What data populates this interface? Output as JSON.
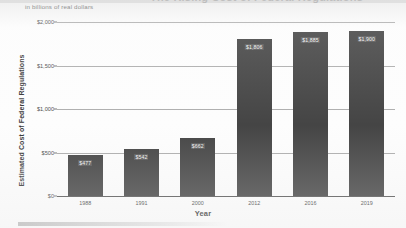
{
  "chart_data": {
    "type": "bar",
    "title": "The Rising Cost of Federal Regulations",
    "subtitle": "in billions of real dollars",
    "xlabel": "Year",
    "ylabel": "Estimated Cost of Federal Regulations",
    "categories": [
      "1988",
      "1991",
      "2000",
      "2012",
      "2016",
      "2019"
    ],
    "values": [
      477,
      542,
      662,
      1806,
      1885,
      1900
    ],
    "value_labels": [
      "$477",
      "$542",
      "$662",
      "$1,806",
      "$1,885",
      "$1,900"
    ],
    "ylim": [
      0,
      2000
    ],
    "yticks": [
      0,
      500,
      1000,
      1500,
      2000
    ],
    "ytick_labels": [
      "$0",
      "$500",
      "$1,000",
      "$1,500",
      "$2,000"
    ],
    "grid": true,
    "legend": false,
    "bar_color": "#3b3b3b",
    "gridline_color": "#8e8e8e",
    "text_color": "#2c2c2c"
  }
}
